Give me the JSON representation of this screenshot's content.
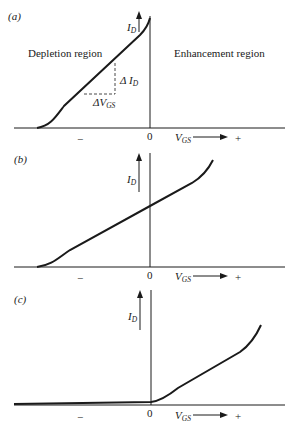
{
  "figure": {
    "panels": [
      {
        "id": "a",
        "label": "(a)",
        "y_axis_label": "I",
        "y_axis_sub": "D",
        "x_axis_label": "V",
        "x_axis_sub": "GS",
        "zero": "0",
        "minus": "−",
        "plus": "+",
        "left_region": "Depletion region",
        "right_region": "Enhancement region",
        "delta_id": "Δ I",
        "delta_id_sub": "D",
        "delta_vgs": "ΔV",
        "delta_vgs_sub": "GS"
      },
      {
        "id": "b",
        "label": "(b)",
        "y_axis_label": "I",
        "y_axis_sub": "D",
        "x_axis_label": "V",
        "x_axis_sub": "GS",
        "zero": "0",
        "minus": "−",
        "plus": "+"
      },
      {
        "id": "c",
        "label": "(c)",
        "y_axis_label": "I",
        "y_axis_sub": "D",
        "x_axis_label": "V",
        "x_axis_sub": "GS",
        "zero": "0",
        "minus": "−",
        "plus": "+"
      }
    ]
  },
  "colors": {
    "ink": "#1a1a1a",
    "background": "#ffffff"
  }
}
